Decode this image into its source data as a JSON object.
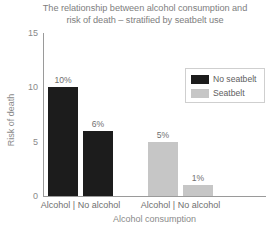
{
  "chart_data": {
    "type": "bar",
    "title": "The relationship between alcohol consumption and risk of death – stratified by seatbelt use",
    "title_lines": [
      "The relationship between alcohol consumption and",
      "risk of death – stratified by seatbelt use"
    ],
    "xlabel": "Alcohol consumption",
    "ylabel": "Risk of death",
    "ylim": [
      0,
      15
    ],
    "yticks": [
      0,
      5,
      10,
      15
    ],
    "ytick_labels": [
      "0",
      "5",
      "10",
      "15"
    ],
    "grid": false,
    "legend_position": "top-right",
    "categories": [
      "Alcohol",
      "No alcohol"
    ],
    "group_labels": [
      "Alcohol | No alcohol",
      "Alcohol | No alcohol"
    ],
    "series": [
      {
        "name": "No seatbelt",
        "color": "#1c1c1c",
        "values": [
          10,
          6
        ],
        "value_labels": [
          "10%",
          "6%"
        ]
      },
      {
        "name": "Seatbelt",
        "color": "#c6c6c6",
        "values": [
          5,
          1
        ],
        "value_labels": [
          "5%",
          "1%"
        ]
      }
    ],
    "bars": [
      {
        "label": "10%",
        "value": 10,
        "series": "No seatbelt",
        "category": "Alcohol",
        "color": "#1c1c1c"
      },
      {
        "label": "6%",
        "value": 6,
        "series": "No seatbelt",
        "category": "No alcohol",
        "color": "#1c1c1c"
      },
      {
        "label": "5%",
        "value": 5,
        "series": "Seatbelt",
        "category": "Alcohol",
        "color": "#c6c6c6"
      },
      {
        "label": "1%",
        "value": 1,
        "series": "Seatbelt",
        "category": "No alcohol",
        "color": "#c6c6c6"
      }
    ]
  },
  "legend": {
    "items": [
      {
        "label": "No seatbelt",
        "color": "#1c1c1c"
      },
      {
        "label": "Seatbelt",
        "color": "#c6c6c6"
      }
    ]
  },
  "colors": {
    "axis": "#9a9a9a",
    "text": "#7b7b7b",
    "no_seatbelt": "#1c1c1c",
    "seatbelt": "#c6c6c6",
    "background": "#ffffff"
  }
}
